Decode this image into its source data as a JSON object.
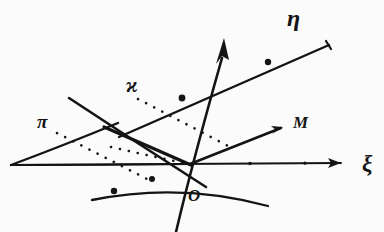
{
  "figure": {
    "style": {
      "background": "#fbfbfb",
      "ink": "#141414"
    },
    "labels": {
      "eta": "η",
      "xi": "ξ",
      "kappa": "ϰ",
      "pi": "π",
      "M": "M",
      "origin": "O"
    },
    "label_positions": {
      "eta": {
        "x": 287,
        "y": 26
      },
      "xi": {
        "x": 362,
        "y": 168
      },
      "kappa": {
        "x": 126,
        "y": 90
      },
      "pi": {
        "x": 41,
        "y": 125
      },
      "M": {
        "x": 297,
        "y": 126
      },
      "origin": {
        "x": 193,
        "y": 199
      }
    },
    "origin_point": {
      "x": 190,
      "y": 164
    },
    "axes": [
      {
        "name": "xi-axis",
        "label": "ξ",
        "from": {
          "x": 10,
          "y": 164
        },
        "to": {
          "x": 345,
          "y": 163
        },
        "arrow": true
      },
      {
        "name": "eta-axis",
        "label": "η",
        "from": {
          "x": 176,
          "y": 232
        },
        "to": {
          "x": 231,
          "y": 37
        },
        "arrow": true
      },
      {
        "name": "M-line",
        "label": "M",
        "from": {
          "x": 190,
          "y": 164
        },
        "to": {
          "x": 281,
          "y": 128
        },
        "arrow": true
      }
    ],
    "lines": [
      {
        "name": "upper-right-ray",
        "from": {
          "x": 120,
          "y": 136
        },
        "to": {
          "x": 328,
          "y": 44
        },
        "marked_points": [
          {
            "x": 182,
            "y": 98
          },
          {
            "x": 268,
            "y": 62
          }
        ]
      },
      {
        "name": "lower-left-ray",
        "from": {
          "x": 92,
          "y": 199
        },
        "to": {
          "x": 268,
          "y": 205
        },
        "marked_points": [
          {
            "x": 114,
            "y": 190
          },
          {
            "x": 152,
            "y": 178
          }
        ]
      },
      {
        "name": "plane-upper-edge",
        "from": {
          "x": 69,
          "y": 98
        },
        "to": {
          "x": 205,
          "y": 186
        }
      },
      {
        "name": "plane-lower-edge",
        "from": {
          "x": 10,
          "y": 164
        },
        "to": {
          "x": 190,
          "y": 164
        }
      },
      {
        "name": "plane-slant-edge",
        "from": {
          "x": 10,
          "y": 164
        },
        "to": {
          "x": 116,
          "y": 124
        }
      },
      {
        "name": "plane-fold-edge",
        "from": {
          "x": 104,
          "y": 128
        },
        "to": {
          "x": 190,
          "y": 164
        }
      }
    ],
    "dotted_lines": [
      {
        "name": "kappa-leader",
        "from": {
          "x": 137,
          "y": 98
        },
        "to": {
          "x": 233,
          "y": 148
        }
      },
      {
        "name": "pi-leader",
        "from": {
          "x": 56,
          "y": 132
        },
        "to": {
          "x": 150,
          "y": 180
        }
      },
      {
        "name": "plane-trace",
        "from": {
          "x": 110,
          "y": 146
        },
        "to": {
          "x": 190,
          "y": 164
        }
      }
    ]
  }
}
